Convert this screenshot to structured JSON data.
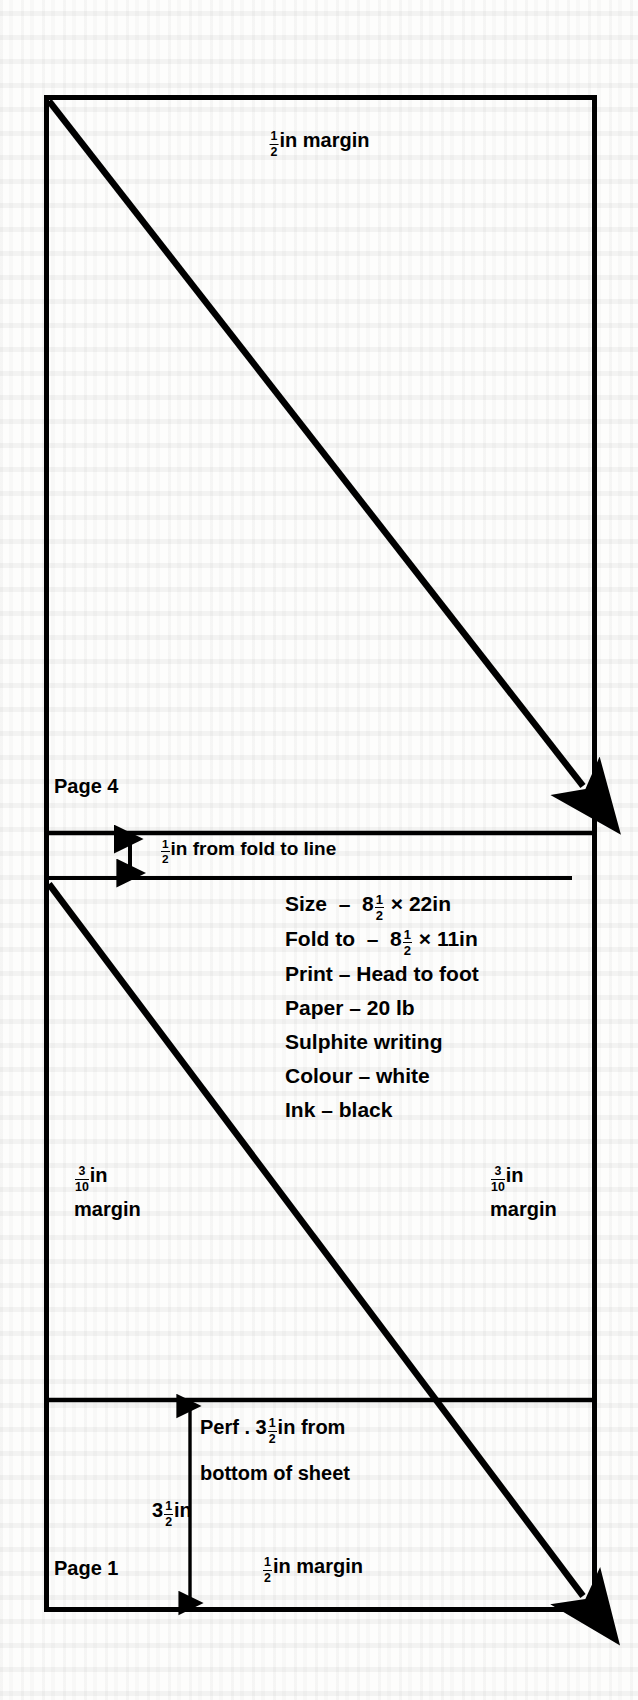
{
  "figure": {
    "type": "form-folding-layout-diagram",
    "title_text": null,
    "ink_color": "#000000",
    "paper_color": "#fdfdfc",
    "panels": [
      {
        "name": "page-4-panel",
        "label": "Page 4"
      },
      {
        "name": "middle-panel",
        "label": ""
      },
      {
        "name": "page-1-panel",
        "label": "Page 1"
      }
    ],
    "labels": {
      "top_margin": {
        "num": "1",
        "den": "2",
        "suffix": "in margin"
      },
      "page_4": "Page 4",
      "fold_to_line": {
        "num": "1",
        "den": "2",
        "suffix": "in from fold  to line"
      },
      "margin_left": {
        "num": "3",
        "den": "10",
        "suffix": "in",
        "line2": "margin"
      },
      "margin_right": {
        "num": "3",
        "den": "10",
        "suffix": "in",
        "line2": "margin"
      },
      "perf_line1_pre": "Perf . 3",
      "perf_line1_num": "1",
      "perf_line1_den": "2",
      "perf_line1_post": "in from",
      "perf_line2": "bottom  of sheet",
      "dim_perf_pre": "3",
      "dim_perf_num": "1",
      "dim_perf_den": "2",
      "dim_perf_post": "in",
      "page_1": "Page 1",
      "bottom_margin": {
        "num": "1",
        "den": "2",
        "suffix": "in margin"
      }
    },
    "specification": {
      "lines": [
        {
          "label": "Size",
          "dash": "–",
          "value_pre": "8",
          "num": "1",
          "den": "2",
          "value_post": " × 22in",
          "full": "Size  –  8½ × 22in"
        },
        {
          "label": "Fold  to",
          "dash": "–",
          "value_pre": "8",
          "num": "1",
          "den": "2",
          "value_post": " × 11in",
          "full": "Fold  to –  8½ × 11in"
        },
        {
          "label": "Print",
          "dash": "–",
          "value_pre": "Head to foot",
          "num": "",
          "den": "",
          "value_post": "",
          "full": "Print – Head to foot"
        },
        {
          "label": "Paper",
          "dash": "–",
          "value_pre": "20 lb",
          "num": "",
          "den": "",
          "value_post": "",
          "full": "Paper – 20 lb"
        },
        {
          "label": "Sulphite  writing",
          "dash": "",
          "value_pre": "",
          "num": "",
          "den": "",
          "value_post": "",
          "full": "Sulphite  writing"
        },
        {
          "label": "Colour",
          "dash": "–",
          "value_pre": "white",
          "num": "",
          "den": "",
          "value_post": "",
          "full": "Colour – white"
        },
        {
          "label": "Ink",
          "dash": "–",
          "value_pre": "black",
          "num": "",
          "den": "",
          "value_post": "",
          "full": "Ink – black"
        }
      ]
    },
    "arrows": {
      "diagonal_upper": {
        "from": [
          49,
          99
        ],
        "to": [
          588,
          790
        ],
        "head": "end"
      },
      "diagonal_lower": {
        "from": [
          49,
          882
        ],
        "to": [
          588,
          1600
        ],
        "head": "end"
      },
      "fold_gap_double": {
        "x": 130,
        "from_y": 833,
        "to_y": 878,
        "head": "both"
      },
      "perf_dimension": {
        "x": 190,
        "from_y": 1400,
        "to_y": 1608,
        "head": "both"
      }
    },
    "rules": {
      "outer_border": {
        "left": 44,
        "top": 95,
        "right": 597,
        "bottom": 1612,
        "stroke": 5
      },
      "fold_line_top": {
        "y": 833,
        "stroke": 4
      },
      "spec_underline": {
        "y": 878,
        "x1": 46,
        "x2": 572,
        "stroke": 4
      },
      "perf_line": {
        "y": 1400,
        "stroke": 4
      }
    }
  }
}
